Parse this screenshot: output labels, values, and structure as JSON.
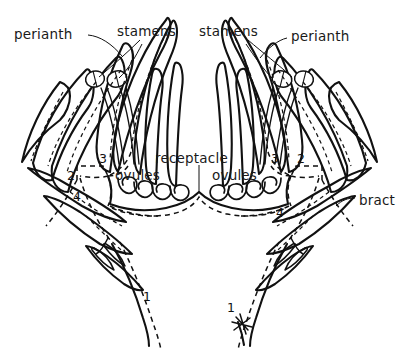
{
  "figure": {
    "kind": "botanical-line-diagram",
    "background_color": "#ffffff",
    "ink_color": "#111111",
    "width": 399,
    "height": 351
  },
  "labels": {
    "perianth_left": "perianth",
    "stamens_left": "stamens",
    "stamens_right": "stamens",
    "perianth_right": "perianth",
    "receptacle": "receptacle",
    "ovules_left": "ovules",
    "ovules_right": "ovules",
    "bract": "bract"
  },
  "numbers": {
    "left_2": "2",
    "left_3": "3",
    "left_4": "4",
    "left_1": "1",
    "right_2": "2",
    "right_3": "3",
    "right_4": "4",
    "right_1": "1"
  },
  "structure": {
    "flowers": 2,
    "stamens_per_flower": 2,
    "ovules_left_count": 4,
    "ovules_right_count": 4,
    "vascular_traces": "dashed"
  }
}
